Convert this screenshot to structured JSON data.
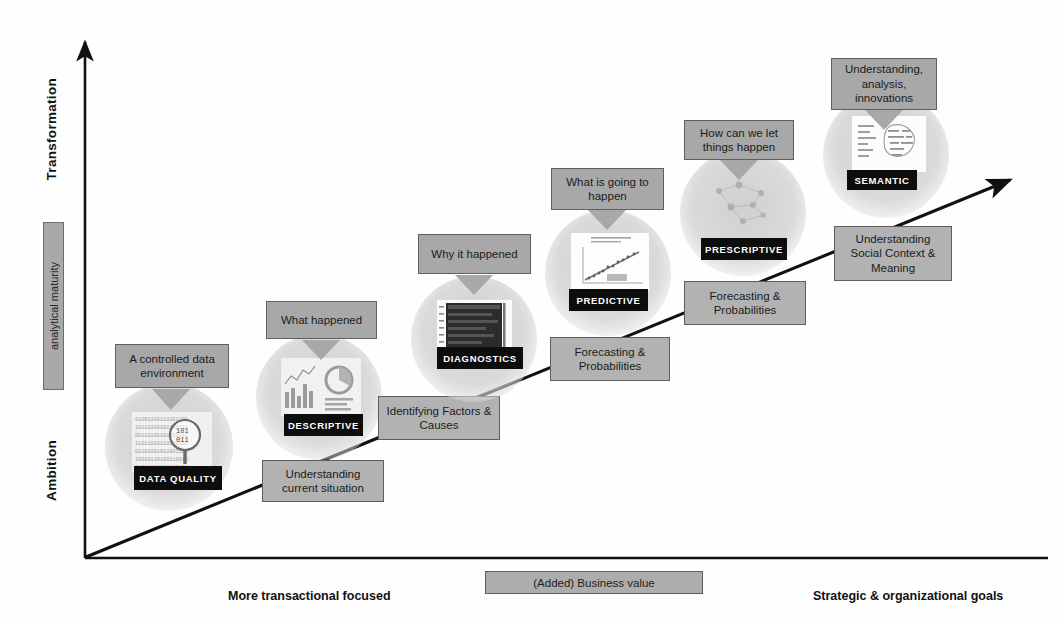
{
  "axes": {
    "y_top_label": "Transformation",
    "y_bottom_label": "Ambition",
    "y_bar_label": "analytical maturity",
    "x_left_label": "More  transactional focused",
    "x_right_label": "Strategic & organizational goals",
    "x_center_legend": "(Added) Business value"
  },
  "colors": {
    "callout_fill": "#a8a8a8",
    "box_fill": "#b2b2b2",
    "border": "#5d5d5d",
    "chip_fill": "#0d0d0d",
    "chip_text": "#ffffff",
    "circle_fill": "#d4d4d4",
    "axis_line": "#111111"
  },
  "stages": [
    {
      "id": "data-quality",
      "callout": "A controlled data environment",
      "chip": "DATA QUALITY",
      "value_box": "Understanding current situation",
      "thumb": "binary-digits-magnifier-image"
    },
    {
      "id": "descriptive",
      "callout": "What happened",
      "chip": "DESCRIPTIVE",
      "value_box": "Identifying Factors & Causes",
      "thumb": "dashboard-charts-image"
    },
    {
      "id": "diagnostics",
      "callout": "Why it happened",
      "chip": "DIAGNOSTICS",
      "value_box": "Forecasting & Probabilities",
      "thumb": "heatmap-matrix-image"
    },
    {
      "id": "predictive",
      "callout": "What is going to happen",
      "chip": "PREDICTIVE",
      "value_box": "Forecasting & Probabilities",
      "thumb": "scatter-regression-image"
    },
    {
      "id": "prescriptive",
      "callout": "How can we let things happen",
      "chip": "PRESCRIPTIVE",
      "value_box": "Understanding Social Context & Meaning",
      "thumb": "network-nodes-image"
    },
    {
      "id": "semantic",
      "callout": "Understanding, analysis, innovations",
      "chip": "SEMANTIC",
      "value_box": "",
      "thumb": "word-cloud-brain-image"
    }
  ]
}
